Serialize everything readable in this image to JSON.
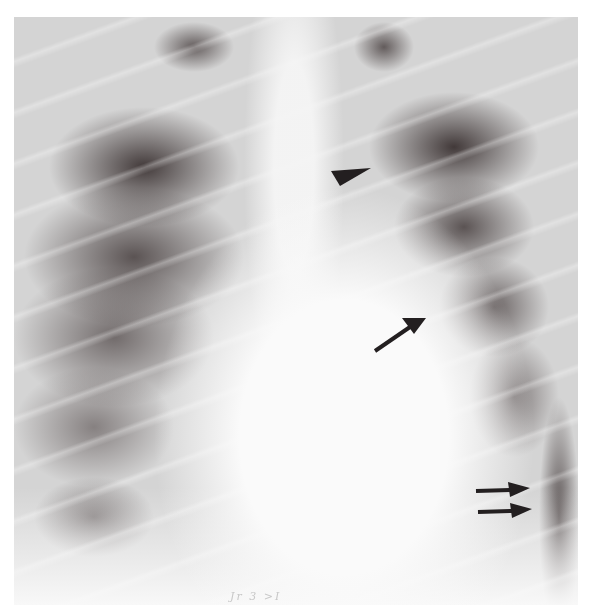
{
  "image": {
    "type": "chest-radiograph",
    "view": "frontal (PA)",
    "background_color": "#ffffff",
    "film_color": "#d4d4d4"
  },
  "annotations": [
    {
      "name": "arrowhead",
      "shape": "triangle",
      "pointing": "right",
      "x": 350,
      "y": 175,
      "color": "#231f20"
    },
    {
      "name": "arrow",
      "shape": "single-arrow",
      "pointing": "up-right",
      "x": 400,
      "y": 333,
      "color": "#231f20"
    },
    {
      "name": "double-arrow-upper",
      "shape": "arrow",
      "pointing": "right",
      "x": 502,
      "y": 489,
      "color": "#231f20"
    },
    {
      "name": "double-arrow-lower",
      "shape": "arrow",
      "pointing": "right",
      "x": 502,
      "y": 510,
      "color": "#231f20"
    }
  ],
  "handwriting": {
    "text": "Jr 3 >I"
  }
}
